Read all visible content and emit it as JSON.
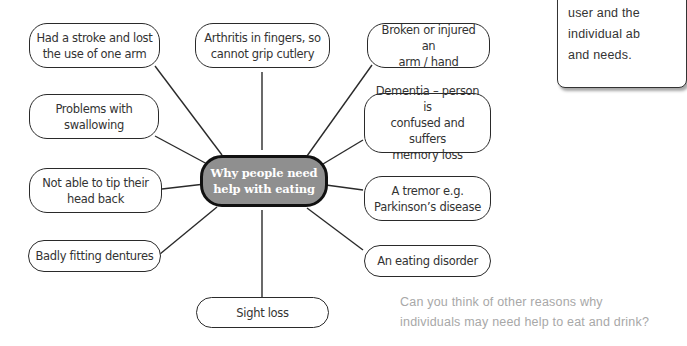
{
  "diagram": {
    "type": "mind-map",
    "center": {
      "line1": "Why people need",
      "line2": "help with eating"
    },
    "nodes": [
      {
        "id": "stroke",
        "line1": "Had a stroke and lost",
        "line2": "the use of one arm"
      },
      {
        "id": "arthritis",
        "line1": "Arthritis in fingers, so",
        "line2": "cannot grip cutlery"
      },
      {
        "id": "broken-arm",
        "line1": "Broken or injured an",
        "line2": "arm / hand"
      },
      {
        "id": "swallowing",
        "line1": "Problems with",
        "line2": "swallowing"
      },
      {
        "id": "dementia",
        "line1": "Dementia – person is",
        "line2": "confused and suffers",
        "line3": "memory loss"
      },
      {
        "id": "tip-head",
        "line1": "Not able to tip their",
        "line2": "head back"
      },
      {
        "id": "tremor",
        "line1": "A tremor e.g.",
        "line2": "Parkinson’s disease"
      },
      {
        "id": "dentures",
        "line1": "Badly fitting dentures"
      },
      {
        "id": "eating-disorder",
        "line1": "An eating disorder"
      },
      {
        "id": "sight-loss",
        "line1": "Sight loss"
      }
    ]
  },
  "side_note": {
    "line1": "user and the",
    "line2": "individual ab",
    "line3": "and needs."
  },
  "question": {
    "line1": "Can you think of other reasons why",
    "line2": "individuals may need help to eat and drink?"
  }
}
